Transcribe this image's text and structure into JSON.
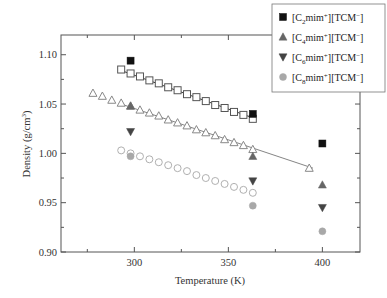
{
  "chart_data": {
    "type": "scatter",
    "title": "",
    "xlabel": "Temperature (K)",
    "ylabel": "Density (g/cm3)",
    "ylabel_display": [
      "Density (g/cm",
      "3",
      ")"
    ],
    "xlim": [
      261,
      420
    ],
    "ylim": [
      0.9,
      1.12
    ],
    "xticks": [
      300,
      350,
      400
    ],
    "xtick_labels": [
      "300",
      "350",
      "400"
    ],
    "xminor": [
      275,
      325,
      375
    ],
    "yticks": [
      0.9,
      0.95,
      1.0,
      1.05,
      1.1
    ],
    "ytick_labels": [
      "0.90",
      "0.95",
      "1.00",
      "1.05",
      "1.10"
    ],
    "yminor": [
      0.925,
      0.975,
      1.025,
      1.075
    ],
    "grid": false,
    "legend_position": "upper right (outside plot, overlapping top)",
    "legend": [
      {
        "label_parts": [
          "[C",
          "2",
          "mim",
          "+",
          "][TCM",
          "−",
          "]"
        ],
        "marker": "square",
        "color": "#111111"
      },
      {
        "label_parts": [
          "[C",
          "4",
          "mim",
          "+",
          "][TCM",
          "−",
          "]"
        ],
        "marker": "triangle-up",
        "color": "#666666"
      },
      {
        "label_parts": [
          "[C",
          "6",
          "mim",
          "+",
          "][TCM",
          "−",
          "]"
        ],
        "marker": "triangle-down",
        "color": "#444444"
      },
      {
        "label_parts": [
          "[C",
          "8",
          "mim",
          "+",
          "][TCM",
          "−",
          "]"
        ],
        "marker": "circle",
        "color": "#a8a8a8"
      }
    ],
    "series": [
      {
        "name": "[C2mim+][TCM-] (filled)",
        "marker": "square",
        "filled": true,
        "color": "#111111",
        "x": [
          298,
          363,
          400
        ],
        "y": [
          1.094,
          1.04,
          1.01
        ]
      },
      {
        "name": "[C4mim+][TCM-] (filled)",
        "marker": "triangle-up",
        "filled": true,
        "color": "#666666",
        "x": [
          298,
          363,
          400
        ],
        "y": [
          1.048,
          0.997,
          0.968
        ]
      },
      {
        "name": "[C6mim+][TCM-] (filled)",
        "marker": "triangle-down",
        "filled": true,
        "color": "#444444",
        "x": [
          298,
          363,
          400
        ],
        "y": [
          1.022,
          0.972,
          0.945
        ]
      },
      {
        "name": "[C8mim+][TCM-] (filled)",
        "marker": "circle",
        "filled": true,
        "color": "#a8a8a8",
        "x": [
          298,
          363,
          400
        ],
        "y": [
          0.997,
          0.947,
          0.921
        ]
      },
      {
        "name": "[C2mim+][TCM-] (open, literature)",
        "marker": "square",
        "filled": false,
        "color": "#555555",
        "x": [
          293,
          298,
          303,
          308,
          313,
          318,
          323,
          328,
          333,
          338,
          343,
          348,
          353,
          358,
          363
        ],
        "y": [
          1.085,
          1.081,
          1.078,
          1.074,
          1.071,
          1.067,
          1.064,
          1.06,
          1.057,
          1.053,
          1.049,
          1.046,
          1.042,
          1.039,
          1.035
        ]
      },
      {
        "name": "[C4mim+][TCM-] (open, literature)",
        "marker": "triangle-up",
        "filled": false,
        "color": "#888888",
        "x": [
          278,
          283,
          288,
          293,
          298,
          303,
          308,
          313,
          318,
          323,
          328,
          333,
          338,
          343,
          348,
          353,
          358,
          363,
          393
        ],
        "y": [
          1.061,
          1.058,
          1.054,
          1.051,
          1.048,
          1.044,
          1.041,
          1.038,
          1.034,
          1.031,
          1.028,
          1.024,
          1.021,
          1.018,
          1.014,
          1.011,
          1.008,
          1.004,
          0.985
        ]
      },
      {
        "name": "[C8mim+][TCM-] (open, literature)",
        "marker": "circle",
        "filled": false,
        "color": "#b0b0b0",
        "x": [
          293,
          298,
          303,
          308,
          313,
          318,
          323,
          328,
          333,
          338,
          343,
          348,
          353,
          358,
          363
        ],
        "y": [
          1.003,
          1.0,
          0.997,
          0.994,
          0.991,
          0.988,
          0.985,
          0.982,
          0.978,
          0.975,
          0.972,
          0.969,
          0.966,
          0.963,
          0.96
        ]
      }
    ],
    "fit_lines": [
      {
        "series": "[C2mim+][TCM-]",
        "x": [
          293,
          363
        ],
        "y": [
          1.084,
          1.036
        ],
        "color": "#222222"
      },
      {
        "series": "[C4mim+][TCM-]",
        "x": [
          293,
          395
        ],
        "y": [
          1.05,
          0.985
        ],
        "color": "#777777"
      }
    ]
  }
}
